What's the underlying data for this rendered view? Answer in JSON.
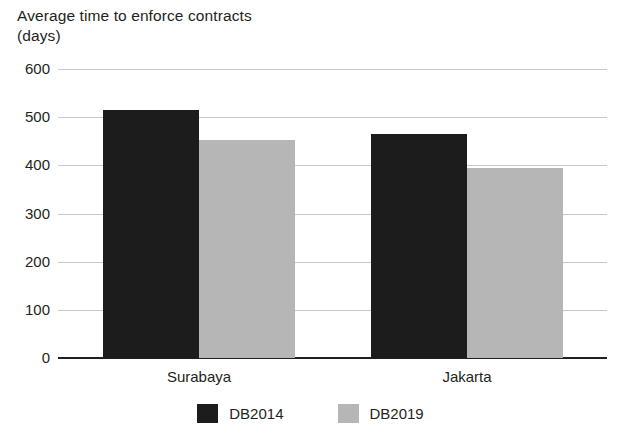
{
  "chart_data": {
    "type": "bar",
    "title": "Average time to enforce contracts\n(days)",
    "xlabel": "",
    "ylabel": "",
    "ylim": [
      0,
      600
    ],
    "ytick_step": 100,
    "yticks": [
      600,
      500,
      400,
      300,
      200,
      100,
      0
    ],
    "ytick_labels": [
      "600",
      "500",
      "400",
      "300",
      "200",
      "100",
      "0"
    ],
    "categories": [
      "Surabaya",
      "Jakarta"
    ],
    "series": [
      {
        "name": "DB2014",
        "color": "#1c1c1c",
        "values": [
          515,
          465
        ]
      },
      {
        "name": "DB2019",
        "color": "#b6b6b6",
        "values": [
          453,
          395
        ]
      }
    ],
    "grid": true,
    "legend_position": "bottom"
  },
  "legend": {
    "items": [
      {
        "label": "DB2014",
        "color": "#1c1c1c"
      },
      {
        "label": "DB2019",
        "color": "#b6b6b6"
      }
    ]
  },
  "colors": {
    "text": "#231f20",
    "gridline": "#c8c8c8",
    "axis": "#231f20",
    "background": "#ffffff",
    "db2014": "#1c1c1c",
    "db2019": "#b6b6b6"
  }
}
